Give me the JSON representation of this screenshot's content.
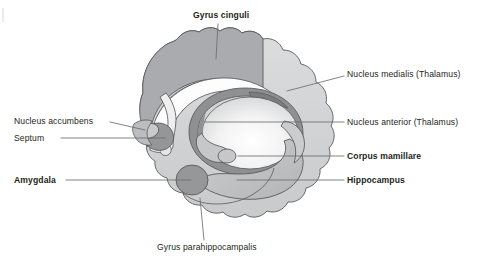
{
  "figure": {
    "type": "anatomical-diagram",
    "background_color": "#ffffff"
  },
  "palette": {
    "cortex_light": "#d2d3d5",
    "cingulate_gray": "#a9abae",
    "hippocampus_gray": "#bfc1c3",
    "amygdala_dark": "#969799",
    "thalamus_ring_dark": "#8e9092",
    "thalamus_body_light": "#f2f2f2",
    "outline": "#58595b",
    "leader_line": "#6d6e71",
    "text": "#231f20"
  },
  "labels": [
    {
      "id": "gyrus-cinguli",
      "text": "Gyrus cinguli",
      "bold": true,
      "x": 193,
      "y": 11,
      "align": "left",
      "leader": {
        "x1": 218,
        "y1": 24,
        "x2": 216,
        "y2": 59
      }
    },
    {
      "id": "nucleus-medialis-thalamus",
      "text": "Nucleus medialis (Thalamus)",
      "bold": false,
      "x": 347,
      "y": 70,
      "align": "left",
      "leader": {
        "x1": 344,
        "y1": 76,
        "x2": 287,
        "y2": 91
      }
    },
    {
      "id": "nucleus-accumbens",
      "text": "Nucleus accumbens",
      "bold": false,
      "x": 14,
      "y": 117,
      "align": "left",
      "leader": {
        "x1": 110,
        "y1": 122,
        "x2": 145,
        "y2": 130
      }
    },
    {
      "id": "nucleus-anterior-thalamus",
      "text": "Nucleus anterior (Thalamus)",
      "bold": false,
      "x": 347,
      "y": 118,
      "align": "left",
      "leader": {
        "x1": 344,
        "y1": 122,
        "x2": 205,
        "y2": 122
      }
    },
    {
      "id": "septum",
      "text": "Septum",
      "bold": false,
      "x": 14,
      "y": 134,
      "align": "left",
      "leader": {
        "x1": 61,
        "y1": 138,
        "x2": 165,
        "y2": 138
      }
    },
    {
      "id": "corpus-mamillare",
      "text": "Corpus mamillare",
      "bold": true,
      "x": 347,
      "y": 152,
      "align": "left",
      "leader": {
        "x1": 344,
        "y1": 156,
        "x2": 238,
        "y2": 156
      }
    },
    {
      "id": "amygdala",
      "text": "Amygdala",
      "bold": true,
      "x": 14,
      "y": 176,
      "align": "left",
      "leader": {
        "x1": 66,
        "y1": 180,
        "x2": 191,
        "y2": 180
      }
    },
    {
      "id": "hippocampus",
      "text": "Hippocampus",
      "bold": true,
      "x": 347,
      "y": 176,
      "align": "left",
      "leader": {
        "x1": 344,
        "y1": 180,
        "x2": 237,
        "y2": 180
      }
    },
    {
      "id": "gyrus-parahippocampalis",
      "text": "Gyrus parahippocampalis",
      "bold": false,
      "x": 157,
      "y": 243,
      "align": "left",
      "leader": {
        "x1": 204,
        "y1": 240,
        "x2": 200,
        "y2": 198
      }
    }
  ]
}
